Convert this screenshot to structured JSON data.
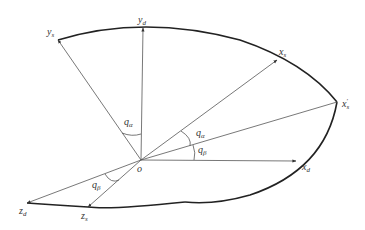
{
  "diagram": {
    "type": "coordinate-frame-rotation",
    "colors": {
      "line": "#555555",
      "curve": "#222222",
      "text": "#333333"
    },
    "origin": {
      "label": "o",
      "x": 141,
      "y": 160
    },
    "axes": [
      {
        "id": "y_d",
        "base": "y",
        "sub": "d",
        "sup": "",
        "tip": [
          143,
          28
        ],
        "label_pos": [
          139,
          22
        ]
      },
      {
        "id": "y_s",
        "base": "y",
        "sub": "s",
        "sup": "",
        "tip": [
          58,
          40
        ],
        "label_pos": [
          47,
          34
        ]
      },
      {
        "id": "x_s",
        "base": "x",
        "sub": "s",
        "sup": "",
        "tip": [
          277,
          60
        ],
        "label_pos": [
          279,
          54
        ]
      },
      {
        "id": "x_s_prime",
        "base": "x",
        "sub": "s",
        "sup": "'",
        "tip": [
          337,
          102
        ],
        "label_pos": [
          342,
          106
        ]
      },
      {
        "id": "x_d",
        "base": "x",
        "sub": "d",
        "sup": "",
        "tip": [
          296,
          161
        ],
        "label_pos": [
          302,
          170
        ]
      },
      {
        "id": "z_d",
        "base": "z",
        "sub": "d",
        "sup": "",
        "tip": [
          27,
          203
        ],
        "label_pos": [
          20,
          214
        ]
      },
      {
        "id": "z_s",
        "base": "z",
        "sub": "s",
        "sup": "",
        "tip": [
          88,
          207
        ],
        "label_pos": [
          82,
          219
        ]
      }
    ],
    "angles": [
      {
        "id": "q_alpha_top",
        "base": "q",
        "sub": "α",
        "label_pos": [
          124,
          124
        ]
      },
      {
        "id": "q_alpha_right",
        "base": "q",
        "sub": "α",
        "label_pos": [
          196,
          135
        ]
      },
      {
        "id": "q_beta_right",
        "base": "q",
        "sub": "β",
        "label_pos": [
          198,
          152
        ]
      },
      {
        "id": "q_beta_lower",
        "base": "q",
        "sub": "β",
        "label_pos": [
          92,
          187
        ]
      }
    ]
  }
}
